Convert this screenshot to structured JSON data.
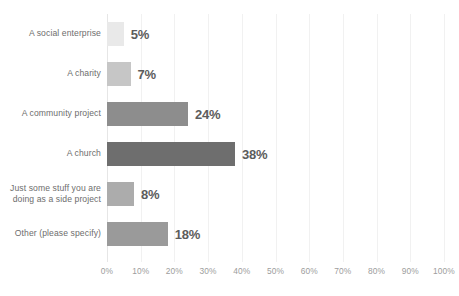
{
  "chart_data": {
    "type": "bar",
    "orientation": "horizontal",
    "title": "",
    "subtitle": "",
    "xlabel": "",
    "ylabel": "",
    "xlim": [
      0,
      100
    ],
    "grid": true,
    "legend": false,
    "categories": [
      "A social enterprise",
      "A charity",
      "A community project",
      "A church",
      "Just some stuff you are\ndoing as a side project",
      "Other (please specify)"
    ],
    "values": [
      5,
      7,
      24,
      38,
      8,
      18
    ],
    "data_labels": [
      "5%",
      "7%",
      "24%",
      "38%",
      "8%",
      "18%"
    ],
    "bar_colors": [
      "#e9e9e9",
      "#c6c6c6",
      "#8d8d8d",
      "#6e6e6e",
      "#acacac",
      "#9a9a9a"
    ],
    "xticks": [
      0,
      10,
      20,
      30,
      40,
      50,
      60,
      70,
      80,
      90,
      100
    ],
    "xtick_labels": [
      "0%",
      "10%",
      "20%",
      "30%",
      "40%",
      "50%",
      "60%",
      "70%",
      "80%",
      "90%",
      "100%"
    ]
  },
  "style": {
    "background": "#ffffff",
    "gridline_color": "#f1f1f1",
    "axis_color": "#e6e6e6",
    "category_label_color": "#6d6d6d",
    "value_label_color": "#5c5c5c",
    "tick_label_color": "#9d9d9d"
  }
}
